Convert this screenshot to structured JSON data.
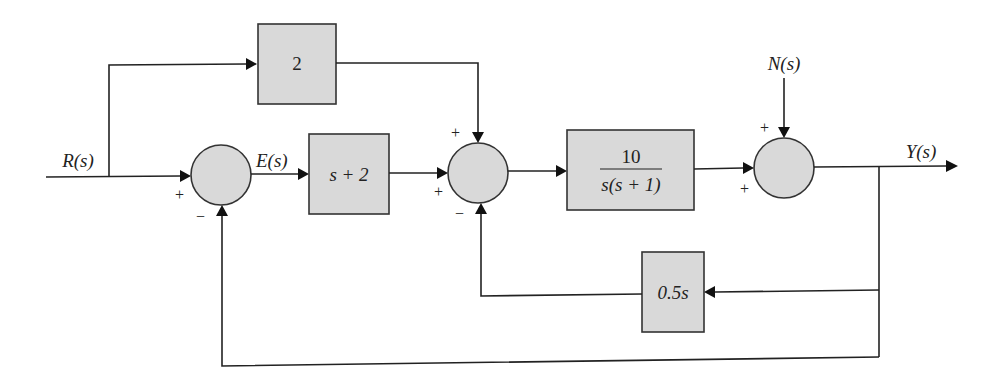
{
  "diagram": {
    "type": "control-system-block-diagram",
    "signals": {
      "input": "R(s)",
      "error": "E(s)",
      "disturbance": "N(s)",
      "output": "Y(s)"
    },
    "blocks": {
      "feedforward": "2",
      "controller": "s + 2",
      "plant_numerator": "10",
      "plant_denominator": "s(s + 1)",
      "inner_feedback": "0.5s"
    },
    "summing_junctions": {
      "sum1": {
        "in_left": "+",
        "in_bottom": "−"
      },
      "sum2": {
        "in_top": "+",
        "in_left": "+",
        "in_bottom": "−"
      },
      "sum3": {
        "in_top": "+",
        "in_left": "+"
      }
    }
  }
}
